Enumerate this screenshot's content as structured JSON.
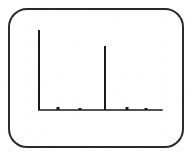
{
  "figure": {
    "frame": {
      "shape": "rounded-rectangle",
      "x": 8,
      "y": 8,
      "width": 176,
      "height": 140,
      "corner_radius": 19,
      "stroke_color": "#2b2b2b",
      "stroke_width": 2,
      "fill_color": "#ffffff"
    },
    "background_color": "#ffffff",
    "ink_color": "#1a1a1a"
  },
  "chart_data": {
    "type": "bar",
    "title": "",
    "subtitle": "",
    "xlabel": "",
    "ylabel": "",
    "xlim": [
      0,
      100
    ],
    "ylim": [
      0,
      100
    ],
    "grid": false,
    "legend": null,
    "axis": {
      "x_axis_line": true,
      "y_axis_line": false,
      "x_tick_labels": [],
      "y_tick_labels": [],
      "baseline_y_px": 110,
      "baseline_x_start_px": 39,
      "baseline_x_end_px": 162,
      "line_color": "#1a1a1a",
      "line_width": 1.6
    },
    "categories": [
      "0",
      "15",
      "22",
      "54",
      "72",
      "87"
    ],
    "values": [
      100,
      4,
      3,
      78,
      3,
      2
    ],
    "points_px": [
      {
        "x": 39,
        "height_px": 80,
        "top_y_px": 30,
        "width_px": 2
      },
      {
        "x": 58,
        "height_px": 3,
        "top_y_px": 107,
        "width_px": 3
      },
      {
        "x": 80,
        "height_px": 2,
        "top_y_px": 108,
        "width_px": 3
      },
      {
        "x": 105,
        "height_px": 64,
        "top_y_px": 46,
        "width_px": 2
      },
      {
        "x": 127,
        "height_px": 3,
        "top_y_px": 107,
        "width_px": 3
      },
      {
        "x": 146,
        "height_px": 2,
        "top_y_px": 108,
        "width_px": 3
      }
    ]
  }
}
